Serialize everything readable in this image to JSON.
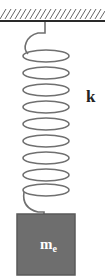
{
  "diagram": {
    "type": "mass-spring system",
    "ceiling": {
      "hatched": true,
      "color": "#3a3a3a"
    },
    "spring": {
      "label": "k",
      "coil_count": 9,
      "color": "#707070"
    },
    "mass": {
      "label_main": "m",
      "label_sub": "e",
      "fill": "#6e6e6e",
      "border": "#5a5a5a",
      "text_color": "#ffffff"
    }
  }
}
